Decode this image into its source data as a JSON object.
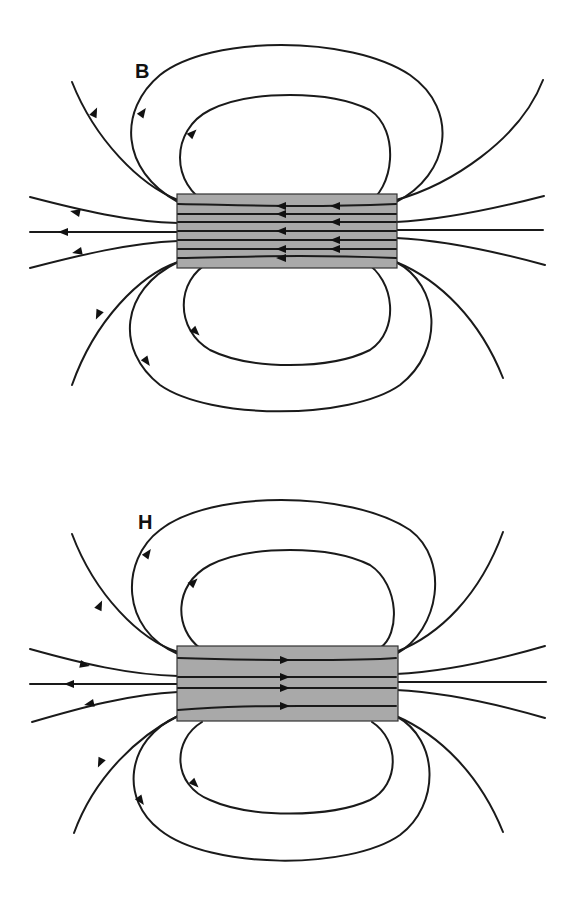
{
  "figure": {
    "panels": [
      {
        "id": "B",
        "label": "B",
        "description": "Magnetic flux density B field lines of a bar magnet; inside the magnet lines point right-to-left (continuous with outside)",
        "inside_direction": "left",
        "magnet_color": "#a9a9a9"
      },
      {
        "id": "H",
        "label": "H",
        "description": "Magnetic field strength H field lines of a bar magnet; inside the magnet lines point left-to-right (opposite to outside, demagnetizing field)",
        "inside_direction": "right",
        "magnet_color": "#a9a9a9"
      }
    ],
    "line_color": "#1a1a1a",
    "background": "#ffffff"
  }
}
